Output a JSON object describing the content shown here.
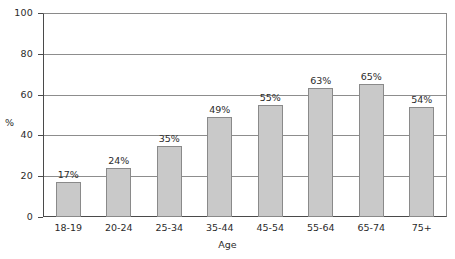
{
  "chart_data": {
    "type": "bar",
    "title": "",
    "xlabel": "Age",
    "ylabel": "%",
    "categories": [
      "18-19",
      "20-24",
      "25-34",
      "35-44",
      "45-54",
      "55-64",
      "65-74",
      "75+"
    ],
    "values": [
      17,
      24,
      35,
      49,
      55,
      63,
      65,
      54
    ],
    "value_labels": [
      "17%",
      "24%",
      "35%",
      "49%",
      "55%",
      "63%",
      "65%",
      "54%"
    ],
    "ylim": [
      0,
      100
    ],
    "yticks": [
      0,
      20,
      40,
      60,
      80,
      100
    ],
    "ytick_labels": [
      "0",
      "20",
      "40",
      "60",
      "80",
      "100"
    ],
    "grid": "horizontal",
    "legend": "none",
    "bar_fill": "#c9c9c9",
    "bar_stroke": "#8a8a8a",
    "axis_color": "#4a4a4a",
    "grid_color": "#8d8d8d"
  }
}
